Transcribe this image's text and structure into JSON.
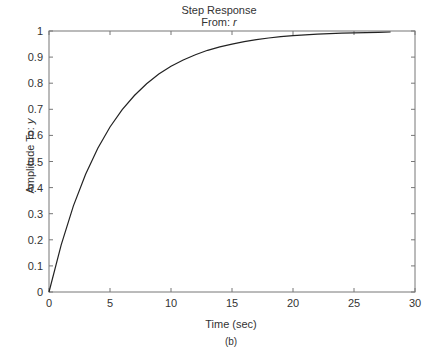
{
  "chart_data": {
    "type": "line",
    "title": "Step Response",
    "subtitle": "From: r",
    "xlabel": "Time (sec)",
    "ylabel": "Amplitude To: y",
    "caption": "(b)",
    "xlim": [
      0,
      30
    ],
    "ylim": [
      0,
      1
    ],
    "xticks": [
      0,
      5,
      10,
      15,
      20,
      25,
      30
    ],
    "yticks": [
      0,
      0.1,
      0.2,
      0.3,
      0.4,
      0.5,
      0.6,
      0.7,
      0.8,
      0.9,
      1
    ],
    "grid": false,
    "legend": null,
    "series": [
      {
        "name": "y",
        "x": [
          0,
          1,
          2,
          3,
          4,
          5,
          6,
          7,
          8,
          9,
          10,
          11,
          12,
          13,
          14,
          15,
          16,
          17,
          18,
          19,
          20,
          21,
          22,
          23,
          24,
          25,
          26,
          27,
          28
        ],
        "values": [
          0,
          0.181,
          0.33,
          0.451,
          0.551,
          0.632,
          0.699,
          0.753,
          0.798,
          0.835,
          0.865,
          0.889,
          0.909,
          0.926,
          0.939,
          0.95,
          0.959,
          0.967,
          0.973,
          0.978,
          0.982,
          0.985,
          0.988,
          0.99,
          0.992,
          0.993,
          0.994,
          0.995,
          0.996
        ]
      }
    ]
  },
  "labels": {
    "title": "Step Response",
    "subtitle_prefix": "From: ",
    "subtitle_var": "r",
    "ylabel_prefix": "Amplitude To: ",
    "ylabel_var": "y",
    "xlabel": "Time (sec)",
    "caption": "(b)"
  },
  "colors": {
    "axis": "#777777",
    "line": "#222222"
  }
}
